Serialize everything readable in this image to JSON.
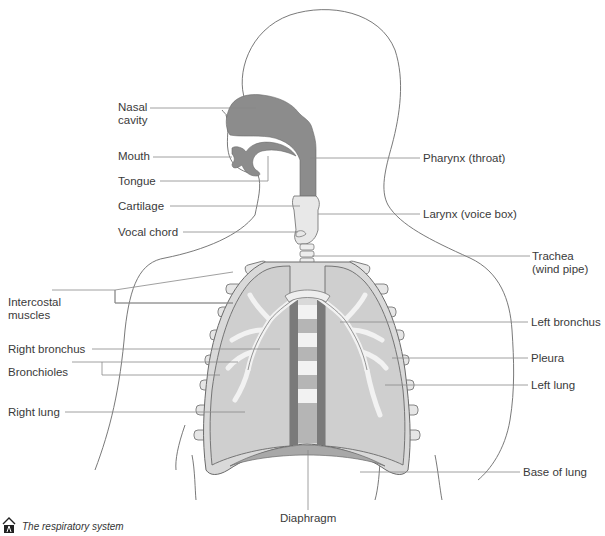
{
  "caption": "The respiratory system",
  "colors": {
    "airway_dark": "#8c8c8c",
    "lung_fill": "#cfcfcf",
    "outline": "#6a6a6a",
    "leader_line": "#888888",
    "label_text": "#3a3a3a"
  },
  "labels": {
    "nasal_cavity": {
      "line1": "Nasal",
      "line2": "cavity"
    },
    "mouth": "Mouth",
    "tongue": "Tongue",
    "cartilage": "Cartilage",
    "vocal_chord": "Vocal chord",
    "pharynx": "Pharynx (throat)",
    "larynx": "Larynx (voice box)",
    "trachea": {
      "line1": "Trachea",
      "line2": "(wind pipe)"
    },
    "intercostal_muscles": {
      "line1": "Intercostal",
      "line2": "muscles"
    },
    "right_bronchus": "Right bronchus",
    "bronchioles": "Bronchioles",
    "right_lung": "Right lung",
    "left_bronchus": "Left bronchus",
    "pleura": "Pleura",
    "left_lung": "Left lung",
    "base_of_lung": "Base of lung",
    "diaphragm": "Diaphragm"
  }
}
